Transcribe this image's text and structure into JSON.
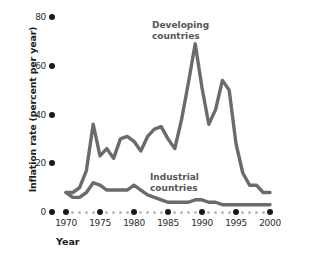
{
  "chart_data": {
    "type": "line",
    "title": "",
    "xlabel": "Year",
    "ylabel": "Inflation rate (percent per year)",
    "xlim": [
      1970,
      2000
    ],
    "ylim": [
      0,
      80
    ],
    "xticks": [
      1970,
      1975,
      1980,
      1985,
      1990,
      1995,
      2000
    ],
    "yticks": [
      0,
      20,
      40,
      60,
      80
    ],
    "minor_xticks_every": 1,
    "grid": false,
    "legend": "inline-annotations",
    "line_color": "#6b6b6b",
    "series": [
      {
        "name": "Developing countries",
        "label_x": 1982.5,
        "label_y": 75,
        "x": [
          1970,
          1971,
          1972,
          1973,
          1974,
          1975,
          1976,
          1977,
          1978,
          1979,
          1980,
          1981,
          1982,
          1983,
          1984,
          1985,
          1986,
          1987,
          1988,
          1989,
          1990,
          1991,
          1992,
          1993,
          1994,
          1995,
          1996,
          1997,
          1998,
          1999,
          2000
        ],
        "values": [
          8,
          8,
          10,
          17,
          36,
          23,
          26,
          22,
          30,
          31,
          29,
          25,
          31,
          34,
          35,
          30,
          26,
          38,
          53,
          69,
          51,
          36,
          42,
          54,
          50,
          28,
          16,
          11,
          11,
          8,
          8
        ]
      },
      {
        "name": "Industrial countries",
        "label_x": 1982,
        "label_y": 16,
        "x": [
          1970,
          1971,
          1972,
          1973,
          1974,
          1975,
          1976,
          1977,
          1978,
          1979,
          1980,
          1981,
          1982,
          1983,
          1984,
          1985,
          1986,
          1987,
          1988,
          1989,
          1990,
          1991,
          1992,
          1993,
          1994,
          1995,
          1996,
          1997,
          1998,
          1999,
          2000
        ],
        "values": [
          8,
          6,
          6,
          8,
          12,
          11,
          9,
          9,
          9,
          9,
          11,
          9,
          7,
          6,
          5,
          4,
          4,
          4,
          4,
          5,
          5,
          4,
          4,
          3,
          3,
          3,
          3,
          3,
          3,
          3,
          3
        ]
      }
    ],
    "annotations": [
      {
        "text": "Developing",
        "second_line": "countries"
      },
      {
        "text": "Industrial",
        "second_line": "countries"
      }
    ]
  },
  "axes": {
    "y": {
      "title": "Inflation rate (percent per year)",
      "tick_labels": [
        "80",
        "60",
        "40",
        "20",
        "0"
      ]
    },
    "x": {
      "title": "Year",
      "tick_labels": [
        "1970",
        "1975",
        "1980",
        "1985",
        "1990",
        "1995",
        "2000"
      ]
    }
  },
  "labels": {
    "developing_line1": "Developing",
    "developing_line2": "countries",
    "industrial_line1": "Industrial",
    "industrial_line2": "countries"
  },
  "colors": {
    "line": "#6b6b6b",
    "tick": "#1a1a1a",
    "minor_tick": "#b9b9b9",
    "text": "#2b2b2b",
    "series_label": "#565656"
  }
}
